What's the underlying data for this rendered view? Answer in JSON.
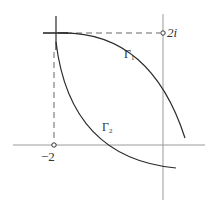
{
  "diagram": {
    "labels": {
      "point_2i": "2i",
      "point_neg2": "−2",
      "gamma1_base": "Γ",
      "gamma1_sub": "1",
      "gamma2_base": "Γ",
      "gamma2_sub": "2"
    },
    "colors": {
      "axis": "#9a9a9a",
      "curve": "#2b2b2b",
      "dashed": "#555555",
      "text": "#333333"
    },
    "points": [
      {
        "name": "2i",
        "x": 163,
        "y": 33
      },
      {
        "name": "-2",
        "x": 54,
        "y": 145
      }
    ],
    "curves": [
      {
        "name": "Γ1",
        "from": "corner near (-2, 2i)",
        "to": "below-right of imaginary axis, above real axis"
      },
      {
        "name": "Γ2",
        "from": "corner near (-2, 2i)",
        "to": "below real axis, right of imaginary axis"
      }
    ]
  }
}
